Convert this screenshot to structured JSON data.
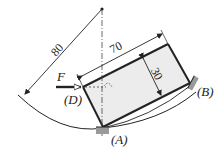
{
  "diagram": {
    "type": "mechanics-statics",
    "dimensions": {
      "radius": "80",
      "length": "70",
      "width": "30"
    },
    "labels": {
      "force": "F",
      "point_a": "(A)",
      "point_b": "(B)",
      "point_d": "(D)"
    },
    "colors": {
      "line": "#222222",
      "plate_fill": "#ececec",
      "support": "#9a9a9a"
    }
  }
}
